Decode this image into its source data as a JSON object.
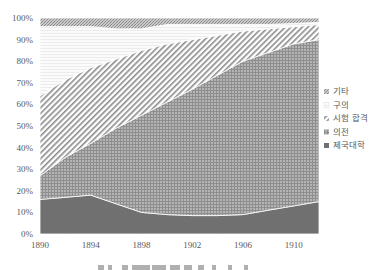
{
  "chart_data": {
    "type": "area",
    "stacked": true,
    "percent": true,
    "title": "",
    "xlabel": "",
    "ylabel": "",
    "x": [
      1890,
      1892,
      1894,
      1896,
      1898,
      1900,
      1902,
      1904,
      1906,
      1908,
      1910,
      1912
    ],
    "x_ticks": [
      "1890",
      "1894",
      "1898",
      "1902",
      "1906",
      "1910"
    ],
    "y_ticks": [
      "0%",
      "10%",
      "20%",
      "30%",
      "40%",
      "50%",
      "60%",
      "70%",
      "80%",
      "90%",
      "100%"
    ],
    "ylim": [
      0,
      100
    ],
    "grid": false,
    "legend_position": "right",
    "series": [
      {
        "name": "제국대학",
        "pattern": "solid-dark",
        "values": [
          16,
          17,
          18,
          14,
          10,
          9,
          8.5,
          8.5,
          9,
          11,
          13,
          15
        ]
      },
      {
        "name": "의전",
        "pattern": "crosshatch",
        "values": [
          11,
          18.5,
          24,
          35,
          45,
          52,
          58.5,
          65,
          71,
          73,
          75,
          75
        ]
      },
      {
        "name": "시험 합격",
        "pattern": "diagonal",
        "values": [
          37,
          36,
          35,
          32,
          30,
          27,
          23,
          18.5,
          14,
          11,
          8,
          7
        ]
      },
      {
        "name": "구의",
        "pattern": "dotted-light",
        "values": [
          32,
          24.5,
          19,
          14,
          10,
          9,
          7,
          5,
          3,
          2,
          1.5,
          1
        ]
      },
      {
        "name": "기타",
        "pattern": "dense-dots",
        "values": [
          4,
          4,
          4,
          5,
          5,
          3,
          3,
          3,
          3,
          3,
          2.5,
          2
        ]
      }
    ],
    "caption": "(clipped caption text, unreadable)"
  },
  "legend": {
    "items": [
      {
        "label": "기타"
      },
      {
        "label": "구의"
      },
      {
        "label": "시험 합격"
      },
      {
        "label": "의전"
      },
      {
        "label": "제국대학"
      }
    ]
  }
}
